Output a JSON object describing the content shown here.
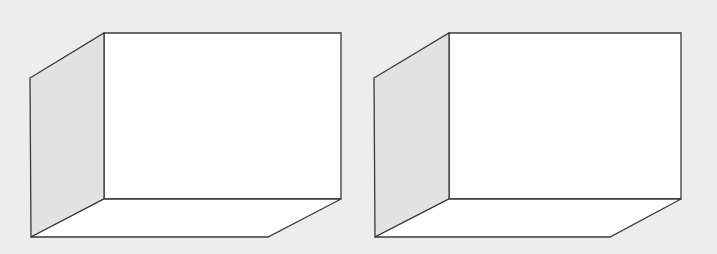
{
  "diagram": {
    "background": "#ededed",
    "stroke": "#3a3a3a",
    "face_fill": "#ffffff",
    "shade_fill": "#e2e2e2",
    "boxes": [
      {
        "name": "box-left",
        "back_face": [
          [
            104,
            33
          ],
          [
            341,
            33
          ],
          [
            341,
            199
          ],
          [
            104,
            199
          ]
        ],
        "side_face": [
          [
            30,
            78
          ],
          [
            104,
            33
          ],
          [
            104,
            199
          ],
          [
            31,
            237
          ]
        ],
        "bottom_face": [
          [
            31,
            237
          ],
          [
            104,
            199
          ],
          [
            341,
            199
          ],
          [
            268,
            237
          ]
        ]
      },
      {
        "name": "box-right",
        "back_face": [
          [
            449,
            33
          ],
          [
            681,
            33
          ],
          [
            681,
            199
          ],
          [
            449,
            199
          ]
        ],
        "side_face": [
          [
            374,
            78
          ],
          [
            449,
            33
          ],
          [
            449,
            199
          ],
          [
            375,
            237
          ]
        ],
        "bottom_face": [
          [
            375,
            237
          ],
          [
            449,
            199
          ],
          [
            681,
            199
          ],
          [
            610,
            237
          ]
        ]
      }
    ]
  }
}
